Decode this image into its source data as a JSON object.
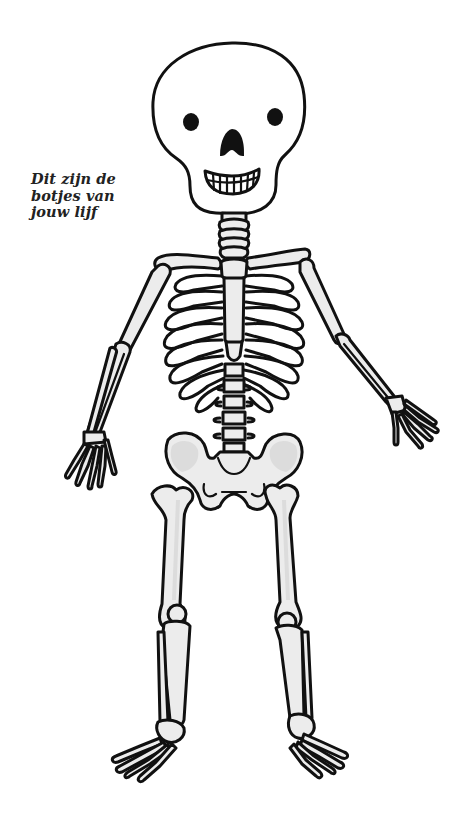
{
  "caption": {
    "lines": [
      "Dit zijn de",
      "botjes van",
      "jouw lijf"
    ],
    "text_color": "#222222"
  },
  "illustration": {
    "subject": "skeleton-drawing",
    "colors": {
      "background": "#ffffff",
      "outline": "#111111",
      "bone_fill": "#ececec",
      "shadow": "#dcdcdc"
    }
  }
}
